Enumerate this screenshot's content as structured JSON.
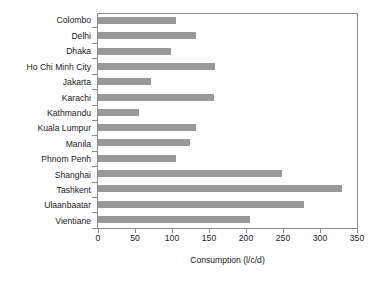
{
  "chart_data": {
    "type": "bar",
    "orientation": "horizontal",
    "title": "",
    "subtitle": "",
    "xlabel": "Consumption (l/c/d)",
    "ylabel": "",
    "xlim": [
      0,
      350
    ],
    "xticks": [
      0,
      50,
      100,
      150,
      200,
      250,
      300,
      350
    ],
    "xtick_labels": [
      "0",
      "50",
      "100",
      "150",
      "200",
      "250",
      "300",
      "350"
    ],
    "grid": false,
    "legend": false,
    "legend_position": "none",
    "bar_color": "#999999",
    "frame_color": "#8c8c8c",
    "background": "#ffffff",
    "categories": [
      "Colombo",
      "Delhi",
      "Dhaka",
      "Ho Chi Minh City",
      "Jakarta",
      "Karachi",
      "Kathmandu",
      "Kuala Lumpur",
      "Manila",
      "Phnom Penh",
      "Shanghai",
      "Tashkent",
      "Ulaanbaatar",
      "Vientiane"
    ],
    "values": [
      105,
      133,
      98,
      158,
      72,
      157,
      56,
      133,
      124,
      106,
      249,
      330,
      279,
      205
    ],
    "series": [
      {
        "name": "Consumption (l/c/d)",
        "values": [
          105,
          133,
          98,
          158,
          72,
          157,
          56,
          133,
          124,
          106,
          249,
          330,
          279,
          205
        ]
      }
    ]
  }
}
